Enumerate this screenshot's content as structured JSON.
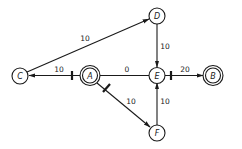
{
  "diagram": {
    "type": "directed-weighted-graph",
    "colors": {
      "stroke": "#1a1a1a",
      "background": "#ffffff"
    },
    "nodes": [
      {
        "id": "A",
        "label": "A",
        "x": 90,
        "y": 75,
        "double": true
      },
      {
        "id": "B",
        "label": "B",
        "x": 213,
        "y": 75,
        "double": true
      },
      {
        "id": "C",
        "label": "C",
        "x": 20,
        "y": 76,
        "double": false
      },
      {
        "id": "D",
        "label": "D",
        "x": 157,
        "y": 16,
        "double": false
      },
      {
        "id": "E",
        "label": "E",
        "x": 157,
        "y": 75,
        "double": false
      },
      {
        "id": "F",
        "label": "F",
        "x": 157,
        "y": 133,
        "double": false
      }
    ],
    "edges": [
      {
        "from": "C",
        "to": "D",
        "weight": "10",
        "directed": true,
        "tick_near_source": false
      },
      {
        "from": "A",
        "to": "C",
        "weight": "10",
        "directed": true,
        "tick_near_source": true
      },
      {
        "from": "A",
        "to": "E",
        "weight": "0",
        "directed": false,
        "tick_near_source": false
      },
      {
        "from": "D",
        "to": "E",
        "weight": "10",
        "directed": true,
        "tick_near_source": false
      },
      {
        "from": "E",
        "to": "B",
        "weight": "20",
        "directed": true,
        "tick_near_source": true
      },
      {
        "from": "A",
        "to": "F",
        "weight": "10",
        "directed": true,
        "tick_near_source": true
      },
      {
        "from": "F",
        "to": "E",
        "weight": "10",
        "directed": true,
        "tick_near_source": false
      }
    ]
  },
  "labels": {
    "node_a": "A",
    "node_b": "B",
    "node_c": "C",
    "node_d": "D",
    "node_e": "E",
    "node_f": "F",
    "edge_c_d": "10",
    "edge_a_c": "10",
    "edge_a_e": "0",
    "edge_d_e": "10",
    "edge_e_b": "20",
    "edge_a_f": "10",
    "edge_f_e": "10"
  }
}
